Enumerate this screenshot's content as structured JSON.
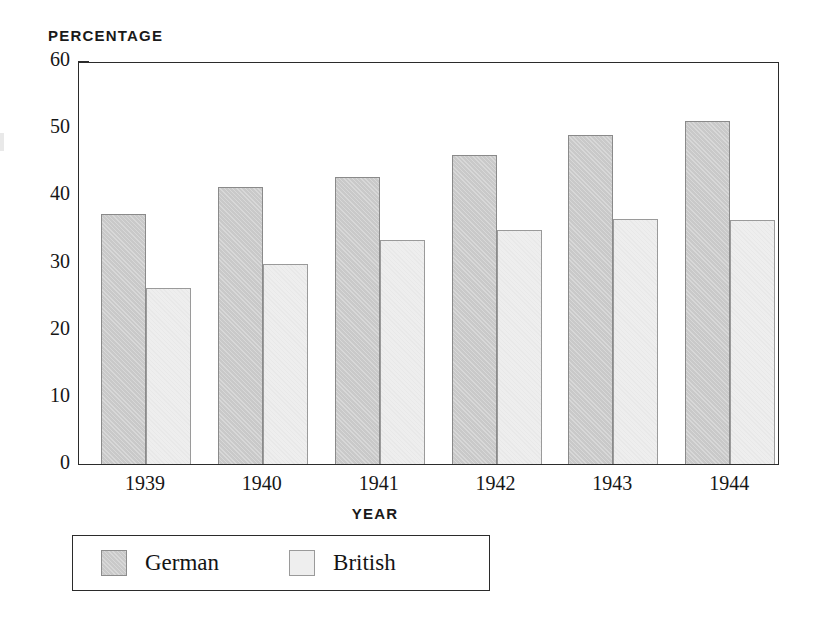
{
  "chart_data": {
    "type": "bar",
    "title": "",
    "ylabel": "Percentage",
    "xlabel": "Year",
    "categories": [
      "1939",
      "1940",
      "1941",
      "1942",
      "1943",
      "1944"
    ],
    "series": [
      {
        "name": "German",
        "color": "#c9c9c9",
        "values": [
          37.2,
          41.2,
          42.7,
          46.0,
          49.0,
          51.1
        ]
      },
      {
        "name": "British",
        "color": "#eeeeee",
        "values": [
          26.2,
          29.8,
          33.3,
          34.8,
          36.5,
          36.4
        ]
      }
    ],
    "ylim": [
      0,
      60
    ],
    "ytick_labels": [
      "0",
      "10",
      "20",
      "30",
      "40",
      "50",
      "60"
    ],
    "ytick_values": [
      0,
      10,
      20,
      30,
      40,
      50,
      60
    ],
    "yminor_values": [
      5,
      15,
      25,
      35,
      45,
      55
    ],
    "grid": false,
    "legend_position": "bottom-left",
    "axis_color": "#2b2b2b"
  },
  "legend": {
    "entries": [
      {
        "label": "German",
        "swatch": "german"
      },
      {
        "label": "British",
        "swatch": "british"
      }
    ]
  }
}
